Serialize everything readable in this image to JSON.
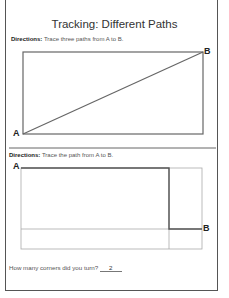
{
  "title": "Tracking: Different Paths",
  "section1": {
    "directions_label": "Directions:",
    "directions_text": "Trace three paths from A to B.",
    "start_label": "A",
    "end_label": "B"
  },
  "section2": {
    "directions_label": "Directions:",
    "directions_text": "Trace the path from A to B.",
    "start_label": "A",
    "end_label": "B"
  },
  "question": {
    "text": "How many corners did you turn?",
    "answer": "2"
  }
}
